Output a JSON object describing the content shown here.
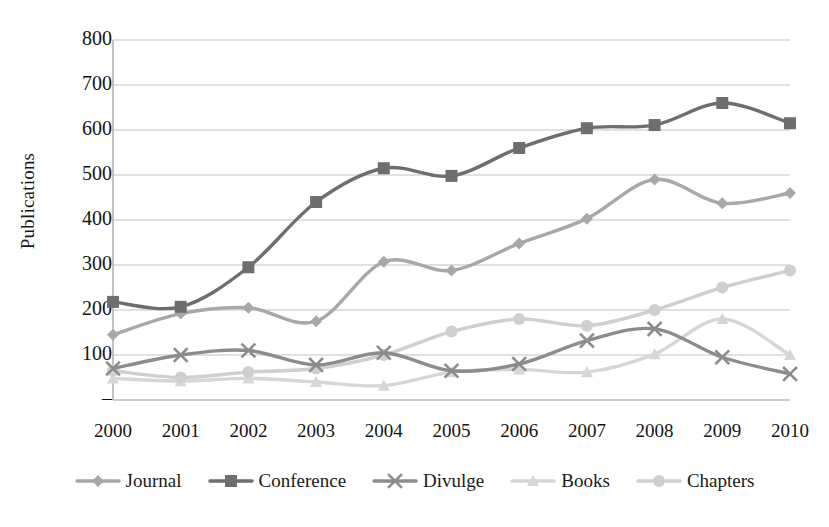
{
  "chart_data": {
    "type": "line",
    "title": "",
    "xlabel": "",
    "ylabel": "Publications",
    "categories": [
      "2000",
      "2001",
      "2002",
      "2003",
      "2004",
      "2005",
      "2006",
      "2007",
      "2008",
      "2009",
      "2010"
    ],
    "x": [
      2000,
      2001,
      2002,
      2003,
      2004,
      2005,
      2006,
      2007,
      2008,
      2009,
      2010
    ],
    "ylim": [
      0,
      800
    ],
    "ytick_labels": [
      "800",
      "700",
      "600",
      "500",
      "400",
      "300",
      "200",
      "100",
      "–"
    ],
    "ytick_values": [
      800,
      700,
      600,
      500,
      400,
      300,
      200,
      100,
      0
    ],
    "grid": true,
    "legend_position": "bottom",
    "series": [
      {
        "name": "Journal",
        "marker": "diamond",
        "color": "#a8a8a8",
        "values": [
          145,
          192,
          205,
          175,
          307,
          288,
          348,
          403,
          490,
          437,
          460
        ]
      },
      {
        "name": "Conference",
        "marker": "square",
        "color": "#6e6e6e",
        "values": [
          218,
          207,
          295,
          440,
          515,
          498,
          560,
          604,
          611,
          660,
          615
        ]
      },
      {
        "name": "Divulge",
        "marker": "x",
        "color": "#8c8c8c",
        "values": [
          70,
          100,
          110,
          78,
          105,
          65,
          80,
          132,
          158,
          95,
          58
        ]
      },
      {
        "name": "Books",
        "marker": "triangle",
        "color": "#d6d6d6",
        "values": [
          48,
          42,
          48,
          40,
          32,
          62,
          68,
          62,
          102,
          180,
          100
        ]
      },
      {
        "name": "Chapters",
        "marker": "circle",
        "color": "#cfcfcf",
        "values": [
          65,
          50,
          62,
          70,
          100,
          152,
          180,
          165,
          200,
          250,
          288
        ]
      }
    ]
  },
  "axes": {
    "y_title": "Publications"
  },
  "legend": {
    "items": [
      {
        "label": "Journal"
      },
      {
        "label": "Conference"
      },
      {
        "label": "Divulge"
      },
      {
        "label": "Books"
      },
      {
        "label": "Chapters"
      }
    ]
  }
}
